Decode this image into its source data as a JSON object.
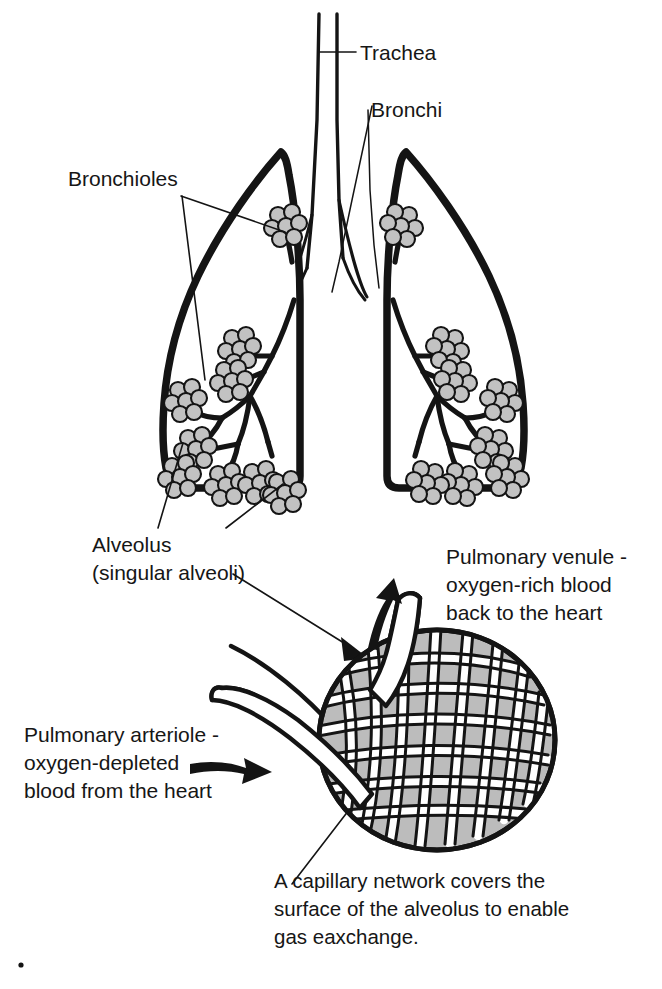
{
  "figure": {
    "background_color": "#ffffff",
    "ink_color": "#141414",
    "alveoli_fill_color": "#c2c2c2",
    "alveolus_fill_color": "#bcbcbc",
    "capillary_color": "#ffffff"
  },
  "labels": {
    "trachea": "Trachea",
    "bronchi": "Bronchi",
    "bronchioles": "Bronchioles",
    "alveolus_line1": "Alveolus",
    "alveolus_line2": "(singular alveoli)",
    "venule_line1": "Pulmonary venule -",
    "venule_line2": "oxygen-rich blood",
    "venule_line3": "back to the heart",
    "arteriole_line1": "Pulmonary arteriole -",
    "arteriole_line2": "oxygen-depleted",
    "arteriole_line3": "blood from the heart",
    "capillary_line1": "A capillary network covers the",
    "capillary_line2": "surface of the alveolus to enable",
    "capillary_line3": "gas eaxchange."
  },
  "parts": {
    "trachea": "trachea-tube",
    "bronchi": "bronchi-branch",
    "left_lung": "left-lung-outline",
    "right_lung": "right-lung-outline",
    "bronchial_tree_left": "bronchial-tree-left",
    "bronchial_tree_right": "bronchial-tree-right",
    "alveoli_clusters": "alveoli-clusters",
    "alveolus_sphere": "alveolus-sphere",
    "capillary_mesh": "capillary-network-mesh",
    "venule_vessel": "pulmonary-venule-vessel",
    "arteriole_vessel": "pulmonary-arteriole-vessel"
  },
  "arrows": {
    "blood_in": "arteriole-flow-arrow",
    "blood_out": "venule-flow-arrow",
    "zoom_pointer": "magnification-pointer-arrow"
  }
}
